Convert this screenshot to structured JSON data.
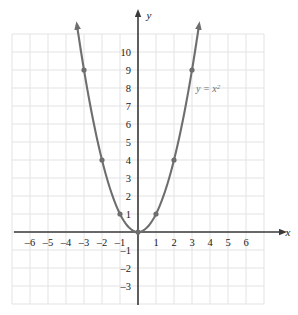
{
  "chart_data": {
    "type": "line",
    "title": "",
    "xlabel": "x",
    "ylabel": "y",
    "equation_label": "y = x",
    "equation_exponent": "2",
    "xlim": [
      -7,
      7
    ],
    "ylim": [
      -4,
      11
    ],
    "xticks": [
      "-6",
      "-5",
      "-4",
      "-3",
      "-2",
      "-1",
      "1",
      "2",
      "3",
      "4",
      "5",
      "6"
    ],
    "xtick_values": [
      -6,
      -5,
      -4,
      -3,
      -2,
      -1,
      1,
      2,
      3,
      4,
      5,
      6
    ],
    "yticks": [
      "10",
      "9",
      "8",
      "7",
      "6",
      "5",
      "4",
      "3",
      "2",
      "1",
      "-1",
      "-2",
      "-3"
    ],
    "ytick_values": [
      10,
      9,
      8,
      7,
      6,
      5,
      4,
      3,
      2,
      1,
      -1,
      -2,
      -3
    ],
    "grid": true,
    "legend": "none",
    "x": [
      -3,
      -2,
      -1,
      0,
      1,
      2,
      3
    ],
    "y": [
      9,
      4,
      1,
      0,
      1,
      4,
      9
    ],
    "marked_points": [
      {
        "x": -3,
        "y": 9
      },
      {
        "x": -2,
        "y": 4
      },
      {
        "x": -1,
        "y": 1
      },
      {
        "x": 0,
        "y": 0
      },
      {
        "x": 1,
        "y": 1
      },
      {
        "x": 2,
        "y": 4
      },
      {
        "x": 3,
        "y": 9
      }
    ],
    "curve_color": "#6e6e6e",
    "point_color": "#6e6e6e",
    "axis_color": "#3a3a3a",
    "grid_color": "#e3e3e6",
    "arrows": [
      "curve-left-end",
      "curve-right-end",
      "x-axis-positive",
      "y-axis-positive"
    ]
  }
}
